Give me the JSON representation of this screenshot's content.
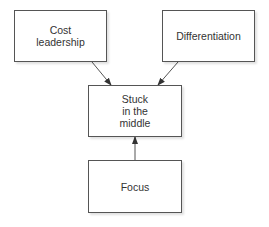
{
  "diagram": {
    "type": "flow",
    "nodes": [
      {
        "id": "cost",
        "label": "Cost\nleadership",
        "x": 14,
        "y": 10,
        "w": 93,
        "h": 52
      },
      {
        "id": "diff",
        "label": "Differentiation",
        "x": 162,
        "y": 10,
        "w": 93,
        "h": 52
      },
      {
        "id": "stuck",
        "label": "Stuck\nin the\nmiddle",
        "x": 88,
        "y": 85,
        "w": 94,
        "h": 52
      },
      {
        "id": "focus",
        "label": "Focus",
        "x": 88,
        "y": 160,
        "w": 94,
        "h": 53
      }
    ],
    "edges": [
      {
        "from": "cost",
        "to": "stuck",
        "x1": 92,
        "y1": 62,
        "x2": 111,
        "y2": 85
      },
      {
        "from": "diff",
        "to": "stuck",
        "x1": 178,
        "y1": 62,
        "x2": 158,
        "y2": 85
      },
      {
        "from": "focus",
        "to": "stuck",
        "x1": 135,
        "y1": 160,
        "x2": 135,
        "y2": 137
      }
    ],
    "colors": {
      "stroke": "#555555",
      "text": "#333333",
      "background": "#ffffff"
    }
  }
}
